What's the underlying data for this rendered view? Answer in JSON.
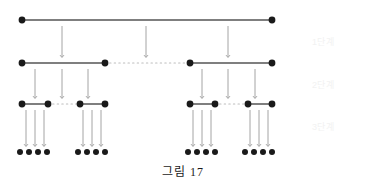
{
  "figure": {
    "caption": "그림 17",
    "caption_y": 162,
    "background": "#ffffff",
    "ink": "#1a1a1a",
    "line_color": "#555555",
    "dotted_color": "#bdbdbd",
    "arrow_color": "#9a9a9a",
    "label_color": "#f2f2f2",
    "width": 366,
    "height": 186
  },
  "stage_labels": [
    {
      "name": "stage-1-label",
      "text": "1단계",
      "x": 312,
      "y": 35
    },
    {
      "name": "stage-2-label",
      "text": "2단계",
      "x": 312,
      "y": 78
    },
    {
      "name": "stage-3-label",
      "text": "3단계",
      "x": 312,
      "y": 120
    }
  ],
  "levels": [
    {
      "name": "level-1",
      "index": 1,
      "y": 20,
      "segments": [
        {
          "type": "solid",
          "x1": 22,
          "x2": 272
        }
      ],
      "nodes": [
        22,
        272
      ],
      "node_radius": 3.4
    },
    {
      "name": "level-2",
      "index": 2,
      "y": 63,
      "segments": [
        {
          "type": "solid",
          "x1": 22,
          "x2": 105
        },
        {
          "type": "dotted",
          "x1": 105,
          "x2": 190
        },
        {
          "type": "solid",
          "x1": 190,
          "x2": 272
        }
      ],
      "nodes": [
        22,
        105,
        190,
        272
      ],
      "node_radius": 3.4
    },
    {
      "name": "level-3",
      "index": 3,
      "y": 104,
      "segments": [
        {
          "type": "solid",
          "x1": 22,
          "x2": 48
        },
        {
          "type": "dotted",
          "x1": 48,
          "x2": 80
        },
        {
          "type": "solid",
          "x1": 80,
          "x2": 105
        },
        {
          "type": "solid",
          "x1": 190,
          "x2": 215
        },
        {
          "type": "dotted",
          "x1": 215,
          "x2": 248
        },
        {
          "type": "solid",
          "x1": 248,
          "x2": 272
        }
      ],
      "nodes": [
        22,
        48,
        80,
        105,
        190,
        215,
        248,
        272
      ],
      "node_radius": 3.4
    }
  ],
  "leaf_row": {
    "name": "leaf-row",
    "y": 152,
    "node_radius": 3.0,
    "groups": [
      {
        "name": "leaf-group-1",
        "dots": [
          20,
          29,
          38,
          47
        ]
      },
      {
        "name": "leaf-group-2",
        "dots": [
          78,
          87,
          96,
          105
        ]
      },
      {
        "name": "leaf-group-3",
        "dots": [
          188,
          197,
          206,
          215
        ]
      },
      {
        "name": "leaf-group-4",
        "dots": [
          245,
          254,
          263,
          272
        ]
      }
    ]
  },
  "arrow_sets": [
    {
      "name": "arrows-level1-to-level2",
      "from_level": 1,
      "to_level": 2,
      "y1": 26,
      "y2": 57,
      "xs": [
        62,
        146,
        228
      ]
    },
    {
      "name": "arrows-level2-to-level3",
      "from_level": 2,
      "to_level": 3,
      "y1": 69,
      "y2": 98,
      "xs": [
        35,
        62,
        88,
        202,
        228,
        255
      ]
    },
    {
      "name": "arrows-level3-to-leaves",
      "from_level": 3,
      "to_level": 4,
      "y1": 110,
      "y2": 146,
      "xs": [
        26,
        35,
        44,
        83,
        92,
        101,
        193,
        202,
        211,
        250,
        259,
        268
      ]
    }
  ]
}
